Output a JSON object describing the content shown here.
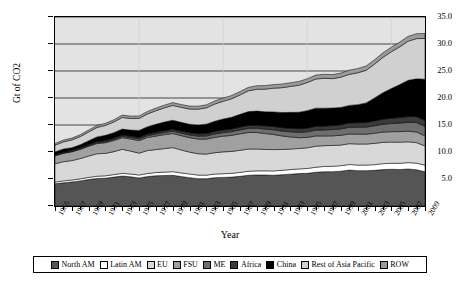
{
  "chart_data": {
    "type": "area",
    "stacked": true,
    "title": "",
    "xlabel": "Year",
    "ylabel": "Gt of CO2",
    "ylim": [
      0,
      35
    ],
    "yticks": [
      0,
      5,
      10,
      15,
      20,
      25,
      30,
      35
    ],
    "ytick_labels": [
      "",
      "5.0",
      "10.0",
      "15.0",
      "20.0",
      "25.0",
      "30.0",
      "35.0"
    ],
    "grid": "horizontal",
    "legend_position": "bottom",
    "x": [
      1965,
      1966,
      1967,
      1968,
      1969,
      1970,
      1971,
      1972,
      1973,
      1974,
      1975,
      1976,
      1977,
      1978,
      1979,
      1980,
      1981,
      1982,
      1983,
      1984,
      1985,
      1986,
      1987,
      1988,
      1989,
      1990,
      1991,
      1992,
      1993,
      1994,
      1995,
      1996,
      1997,
      1998,
      1999,
      2000,
      2001,
      2002,
      2003,
      2004,
      2005,
      2006,
      2007,
      2008,
      2009
    ],
    "xtick_labels": [
      "1965",
      "1967",
      "1969",
      "1971",
      "1973",
      "1975",
      "1977",
      "1979",
      "1981",
      "1983",
      "1985",
      "1987",
      "1989",
      "1991",
      "1993",
      "1995",
      "1997",
      "1999",
      "2001",
      "2003",
      "2005",
      "2007",
      "2009"
    ],
    "series": [
      {
        "name": "North AM",
        "color": "#555555",
        "values": [
          4.1,
          4.3,
          4.45,
          4.65,
          4.9,
          5.1,
          5.15,
          5.35,
          5.55,
          5.4,
          5.2,
          5.45,
          5.6,
          5.65,
          5.7,
          5.45,
          5.25,
          5.05,
          5.05,
          5.25,
          5.3,
          5.35,
          5.5,
          5.7,
          5.75,
          5.75,
          5.7,
          5.8,
          5.9,
          6.0,
          6.05,
          6.25,
          6.35,
          6.35,
          6.45,
          6.65,
          6.55,
          6.55,
          6.6,
          6.75,
          6.8,
          6.75,
          6.85,
          6.7,
          6.35
        ]
      },
      {
        "name": "Latin AM",
        "color": "#ffffff",
        "values": [
          0.33,
          0.35,
          0.36,
          0.38,
          0.4,
          0.42,
          0.44,
          0.47,
          0.5,
          0.52,
          0.54,
          0.57,
          0.6,
          0.63,
          0.66,
          0.68,
          0.68,
          0.68,
          0.66,
          0.67,
          0.68,
          0.7,
          0.72,
          0.74,
          0.76,
          0.77,
          0.79,
          0.82,
          0.84,
          0.87,
          0.9,
          0.93,
          0.97,
          1.0,
          1.02,
          1.04,
          1.03,
          1.04,
          1.05,
          1.09,
          1.12,
          1.15,
          1.19,
          1.23,
          1.22
        ]
      },
      {
        "name": "EU",
        "color": "#d8d8d8",
        "values": [
          3.4,
          3.55,
          3.6,
          3.75,
          3.95,
          4.15,
          4.15,
          4.25,
          4.45,
          4.25,
          4.05,
          4.25,
          4.25,
          4.35,
          4.45,
          4.25,
          4.05,
          3.95,
          3.9,
          3.95,
          4.05,
          4.05,
          4.1,
          4.1,
          4.05,
          3.95,
          3.95,
          3.85,
          3.8,
          3.78,
          3.82,
          3.9,
          3.85,
          3.86,
          3.82,
          3.85,
          3.9,
          3.88,
          3.95,
          3.95,
          3.92,
          3.92,
          3.85,
          3.8,
          3.55
        ]
      },
      {
        "name": "FSU",
        "color": "#a0a0a0",
        "values": [
          1.45,
          1.55,
          1.62,
          1.7,
          1.8,
          1.9,
          1.98,
          2.06,
          2.15,
          2.24,
          2.33,
          2.42,
          2.5,
          2.58,
          2.62,
          2.66,
          2.68,
          2.72,
          2.78,
          2.85,
          2.9,
          2.98,
          3.05,
          3.08,
          3.05,
          2.95,
          2.8,
          2.5,
          2.25,
          2.0,
          1.92,
          1.9,
          1.8,
          1.78,
          1.8,
          1.8,
          1.83,
          1.82,
          1.88,
          1.9,
          1.92,
          1.96,
          1.96,
          1.98,
          1.85
        ]
      },
      {
        "name": "ME",
        "color": "#6e6e6e",
        "values": [
          0.1,
          0.11,
          0.12,
          0.14,
          0.16,
          0.18,
          0.2,
          0.22,
          0.25,
          0.27,
          0.3,
          0.33,
          0.37,
          0.4,
          0.44,
          0.47,
          0.5,
          0.54,
          0.58,
          0.62,
          0.66,
          0.7,
          0.73,
          0.77,
          0.8,
          0.84,
          0.88,
          0.92,
          0.96,
          1.0,
          1.04,
          1.08,
          1.12,
          1.16,
          1.2,
          1.24,
          1.28,
          1.33,
          1.38,
          1.45,
          1.52,
          1.58,
          1.66,
          1.74,
          1.78
        ]
      },
      {
        "name": "Africa",
        "color": "#3a3a3a",
        "values": [
          0.14,
          0.15,
          0.16,
          0.17,
          0.18,
          0.2,
          0.21,
          0.23,
          0.25,
          0.26,
          0.28,
          0.3,
          0.32,
          0.34,
          0.36,
          0.38,
          0.4,
          0.42,
          0.44,
          0.46,
          0.48,
          0.5,
          0.52,
          0.54,
          0.56,
          0.58,
          0.6,
          0.62,
          0.64,
          0.66,
          0.68,
          0.7,
          0.72,
          0.74,
          0.77,
          0.8,
          0.83,
          0.86,
          0.9,
          0.94,
          0.98,
          1.02,
          1.06,
          1.1,
          1.12
        ]
      },
      {
        "name": "China",
        "color": "#000000",
        "values": [
          0.5,
          0.55,
          0.5,
          0.55,
          0.7,
          0.85,
          0.95,
          1.0,
          1.1,
          1.12,
          1.3,
          1.35,
          1.5,
          1.6,
          1.65,
          1.6,
          1.58,
          1.65,
          1.75,
          1.9,
          2.05,
          2.15,
          2.35,
          2.55,
          2.6,
          2.6,
          2.7,
          2.8,
          2.95,
          3.05,
          3.25,
          3.35,
          3.3,
          3.25,
          3.2,
          3.25,
          3.35,
          3.6,
          4.25,
          4.9,
          5.5,
          6.1,
          6.7,
          7.0,
          7.6
        ]
      },
      {
        "name": "Rest of Asia Pacific",
        "color": "#d0d0d0",
        "values": [
          1.25,
          1.32,
          1.42,
          1.52,
          1.62,
          1.75,
          1.85,
          1.98,
          2.15,
          2.15,
          2.22,
          2.38,
          2.5,
          2.62,
          2.75,
          2.78,
          2.82,
          2.92,
          3.02,
          3.18,
          3.28,
          3.42,
          3.6,
          3.85,
          4.05,
          4.2,
          4.4,
          4.6,
          4.8,
          5.0,
          5.2,
          5.4,
          5.55,
          5.45,
          5.6,
          5.75,
          5.9,
          6.05,
          6.25,
          6.55,
          6.8,
          7.0,
          7.25,
          7.45,
          7.55
        ]
      },
      {
        "name": "ROW",
        "color": "#9a9a9a",
        "values": [
          0.32,
          0.33,
          0.34,
          0.35,
          0.36,
          0.38,
          0.39,
          0.41,
          0.43,
          0.44,
          0.45,
          0.47,
          0.49,
          0.5,
          0.52,
          0.53,
          0.54,
          0.55,
          0.56,
          0.58,
          0.59,
          0.61,
          0.62,
          0.64,
          0.65,
          0.66,
          0.67,
          0.68,
          0.69,
          0.7,
          0.71,
          0.73,
          0.74,
          0.75,
          0.76,
          0.78,
          0.79,
          0.8,
          0.82,
          0.84,
          0.86,
          0.88,
          0.9,
          0.92,
          0.93
        ]
      }
    ]
  },
  "axes": {
    "y_title": "Gt of CO2",
    "x_title": "Year"
  }
}
